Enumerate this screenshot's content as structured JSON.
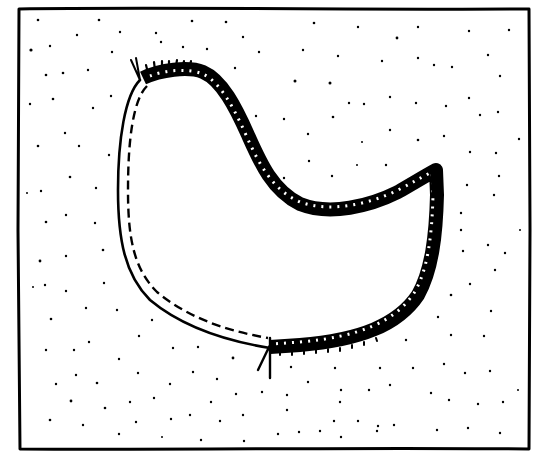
{
  "illustration": {
    "description": "Hand-drawn sketch of a closed blob region on a stippled background inside a rectangular frame",
    "ink_color": "#000000",
    "paper_color": "#ffffff",
    "frame": {
      "x1": 18,
      "y1": 8,
      "x2": 530,
      "y2": 450
    },
    "shape": {
      "thick_hatched_edge": "top-right and bottom-right boundary (from upper-left marker clockwise to lower marker)",
      "thin_dashed_edge": "left and bottom-left boundary (double line, inner dashed)",
      "markers": [
        {
          "name": "start-marker",
          "x": 140,
          "y": 72
        },
        {
          "name": "end-marker",
          "x": 268,
          "y": 350
        }
      ]
    }
  }
}
